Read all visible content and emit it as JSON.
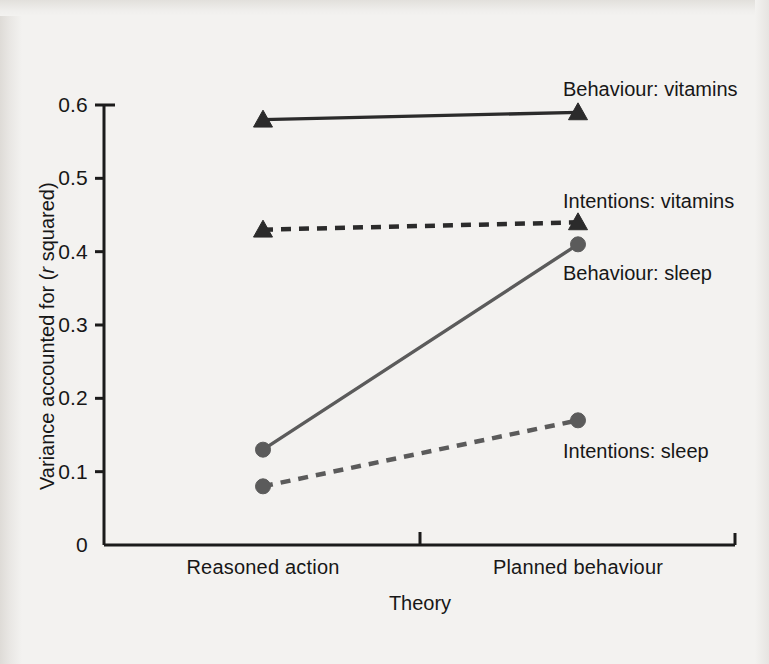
{
  "chart_data": {
    "type": "line",
    "title": "",
    "xlabel": "Theory",
    "ylabel": "Variance accounted for (r squared)",
    "ylabel_parts": {
      "pre": "Variance accounted for (",
      "italic": "r",
      "post": " squared)"
    },
    "categories": [
      "Reasoned action",
      "Planned behaviour"
    ],
    "ylim": [
      0,
      0.6
    ],
    "yticks": [
      0,
      0.1,
      0.2,
      0.3,
      0.4,
      0.5,
      0.6
    ],
    "ytick_labels": [
      "0",
      "0.1",
      "0.2",
      "0.3",
      "0.4",
      "0.5",
      "0.6"
    ],
    "grid": false,
    "legend_position": "inline-annotations",
    "series": [
      {
        "name": "Behaviour: vitamins",
        "values": [
          0.58,
          0.59
        ],
        "marker": "triangle",
        "linestyle": "solid",
        "color": "#2b2b2b",
        "label_x": 563,
        "label_y": 78
      },
      {
        "name": "Intentions: vitamins",
        "values": [
          0.43,
          0.44
        ],
        "marker": "triangle",
        "linestyle": "dashed",
        "color": "#2b2b2b",
        "label_x": 563,
        "label_y": 190
      },
      {
        "name": "Behaviour: sleep",
        "values": [
          0.13,
          0.41
        ],
        "marker": "circle",
        "linestyle": "solid",
        "color": "#5b5b5b",
        "label_x": 563,
        "label_y": 262
      },
      {
        "name": "Intentions: sleep",
        "values": [
          0.08,
          0.17
        ],
        "marker": "circle",
        "linestyle": "dashed",
        "color": "#5b5b5b",
        "label_x": 563,
        "label_y": 440
      }
    ]
  },
  "axes": {
    "y_tick_label_x": 88,
    "x_tick_label_y": 556,
    "x_title_x": 420,
    "x_title_y": 592,
    "y_title_left": 36,
    "y_title_top": 490
  },
  "colors": {
    "background": "#f3f2f0",
    "axis": "#1b1b1b",
    "dark_series": "#2b2b2b",
    "grey_series": "#5b5b5b"
  }
}
